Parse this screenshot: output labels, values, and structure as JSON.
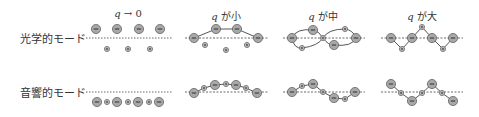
{
  "rows": [
    {
      "label": "光学的モード",
      "baseline_y": 38
    },
    {
      "label": "音響的モード",
      "baseline_y": 92
    }
  ],
  "columns": [
    {
      "q": "q",
      "title_suffix": " → 0",
      "cx": 128
    },
    {
      "q": "q",
      "title_suffix": " が小",
      "cx": 226
    },
    {
      "q": "q",
      "title_suffix": " が中",
      "cx": 323
    },
    {
      "q": "q",
      "title_suffix": " が大",
      "cx": 422
    }
  ],
  "colors": {
    "ion_fill": "#a8a8a8",
    "ion_stroke": "#555555",
    "line": "#444444",
    "text": "#333333"
  },
  "diagrams": {
    "optical": [
      {
        "minus": [
          [
            96,
            29
          ],
          [
            117,
            29
          ],
          [
            139,
            29
          ],
          [
            160,
            29
          ]
        ],
        "plus": [
          [
            107,
            49
          ],
          [
            128,
            49
          ],
          [
            150,
            49
          ]
        ],
        "chain": false
      },
      {
        "minus": [
          [
            194,
            38
          ],
          [
            216,
            29
          ],
          [
            237,
            29
          ],
          [
            258,
            38
          ]
        ],
        "plus": [
          [
            205,
            45
          ],
          [
            226,
            50
          ],
          [
            247,
            45
          ]
        ],
        "chain": "minus-only"
      },
      {
        "minus": [
          [
            292,
            38
          ],
          [
            313,
            30
          ],
          [
            334,
            45
          ],
          [
            356,
            38
          ]
        ],
        "plus": [
          [
            302,
            48
          ],
          [
            323,
            38
          ],
          [
            345,
            29
          ]
        ],
        "chain": "figure8"
      },
      {
        "minus": [
          [
            391,
            38
          ],
          [
            412,
            38
          ],
          [
            432,
            38
          ],
          [
            453,
            38
          ]
        ],
        "plus": [
          [
            402,
            49
          ],
          [
            422,
            27
          ],
          [
            443,
            49
          ]
        ],
        "chain": "zigzag"
      }
    ],
    "acoustic": [
      {
        "sequence": [
          [
            "-",
            97,
            102
          ],
          [
            "+",
            107,
            102
          ],
          [
            "-",
            117,
            102
          ],
          [
            "+",
            128,
            102
          ],
          [
            "-",
            138,
            102
          ],
          [
            "+",
            149,
            102
          ],
          [
            "-",
            159,
            102
          ]
        ],
        "chain": false
      },
      {
        "sequence": [
          [
            "-",
            194,
            93
          ],
          [
            "+",
            204,
            88
          ],
          [
            "-",
            215,
            85
          ],
          [
            "+",
            226,
            84
          ],
          [
            "-",
            236,
            85
          ],
          [
            "+",
            246,
            88
          ],
          [
            "-",
            257,
            93
          ]
        ],
        "chain": true
      },
      {
        "sequence": [
          [
            "-",
            292,
            92
          ],
          [
            "+",
            302,
            86
          ],
          [
            "-",
            313,
            84
          ],
          [
            "+",
            323,
            92
          ],
          [
            "-",
            334,
            98
          ],
          [
            "+",
            345,
            99
          ],
          [
            "-",
            355,
            92
          ]
        ],
        "chain": true
      },
      {
        "sequence": [
          [
            "-",
            391,
            84
          ],
          [
            "+",
            401,
            93
          ],
          [
            "-",
            412,
            101
          ],
          [
            "+",
            422,
            93
          ],
          [
            "-",
            432,
            84
          ],
          [
            "+",
            442,
            93
          ],
          [
            "-",
            453,
            101
          ]
        ],
        "chain": true
      }
    ]
  }
}
